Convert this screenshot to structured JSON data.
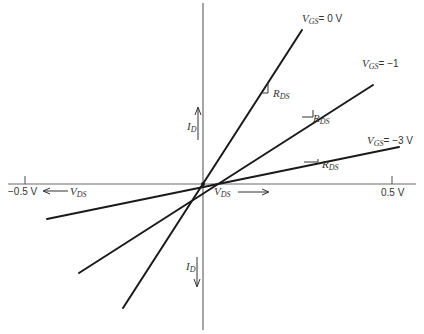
{
  "diagram": {
    "type": "JFET/MOSFET output characteristics near origin (voltage-controlled resistor region)",
    "axes": {
      "x_label_positive": {
        "main": "V",
        "sub": "DS"
      },
      "x_label_negative": {
        "main": "V",
        "sub": "DS"
      },
      "y_label_positive": {
        "main": "I",
        "sub": "D"
      },
      "y_label_negative": {
        "main": "I",
        "sub": "D"
      },
      "x_tick_positive": "0.5 V",
      "x_tick_negative": "−0.5 V"
    },
    "lines": [
      {
        "id": "vgs0",
        "label_main": "V",
        "label_sub": "GS",
        "label_value": "= 0 V",
        "marker_label": {
          "main": "R",
          "sub": "DS"
        }
      },
      {
        "id": "vgsm1",
        "label_main": "V",
        "label_sub": "GS",
        "label_value": "= −1",
        "marker_label": {
          "main": "R",
          "sub": "DS"
        }
      },
      {
        "id": "vgsm3",
        "label_main": "V",
        "label_sub": "GS",
        "label_value": "= −3 V",
        "marker_label": {
          "main": "R",
          "sub": "DS"
        }
      }
    ],
    "colors": {
      "line": "#1a1a1a",
      "axis": "#6a6a6a",
      "text": "#333333",
      "background": "#ffffff"
    }
  }
}
